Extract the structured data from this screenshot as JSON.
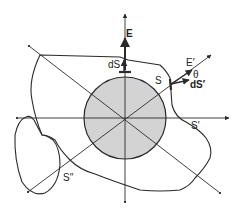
{
  "diagram": {
    "type": "gauss-law-surfaces",
    "colors": {
      "stroke": "#2a2a2a",
      "sphere_fill": "#d3d3d3",
      "background": "#ffffff"
    },
    "center": [
      125,
      118
    ],
    "sphere_radius": 41,
    "labels": {
      "E": "E",
      "dS": "dS",
      "S": "S",
      "E_prime": "E′",
      "theta": "θ",
      "dS_prime": "dS′",
      "S_prime": "S′",
      "S_double_prime": "S′′"
    }
  }
}
